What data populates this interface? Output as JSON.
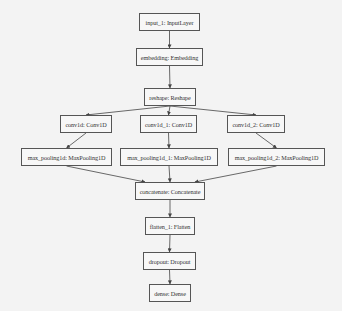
{
  "diagram": {
    "type": "keras-model-plot",
    "colors": {
      "background": "#f3f3f3",
      "node_border": "#555555",
      "edge": "#444444",
      "text": "#333333"
    },
    "nodes": [
      {
        "id": "input_1",
        "label": "input_1: InputLayer",
        "x": 139,
        "y": 13,
        "w": 61,
        "h": 18
      },
      {
        "id": "embedding",
        "label": "embedding: Embedding",
        "x": 136,
        "y": 48,
        "w": 67,
        "h": 18
      },
      {
        "id": "reshape",
        "label": "reshape: Reshape",
        "x": 144,
        "y": 88,
        "w": 52,
        "h": 18
      },
      {
        "id": "conv1d",
        "label": "conv1d: Conv1D",
        "x": 60,
        "y": 115,
        "w": 52,
        "h": 18
      },
      {
        "id": "conv1d_1",
        "label": "conv1d_1: Conv1D",
        "x": 140,
        "y": 115,
        "w": 57,
        "h": 18
      },
      {
        "id": "conv1d_2",
        "label": "conv1d_2: Conv1D",
        "x": 227,
        "y": 115,
        "w": 58,
        "h": 18
      },
      {
        "id": "max_pooling1d",
        "label": "max_pooling1d: MaxPooling1D",
        "x": 21,
        "y": 148,
        "w": 91,
        "h": 18
      },
      {
        "id": "max_pooling1d_1",
        "label": "max_pooling1d_1: MaxPooling1D",
        "x": 120,
        "y": 148,
        "w": 98,
        "h": 18
      },
      {
        "id": "max_pooling1d_2",
        "label": "max_pooling1d_2: MaxPooling1D",
        "x": 228,
        "y": 148,
        "w": 97,
        "h": 18
      },
      {
        "id": "concatenate",
        "label": "concatenate: Concatenate",
        "x": 135,
        "y": 182,
        "w": 70,
        "h": 18
      },
      {
        "id": "flatten_1",
        "label": "flatten_1: Flatten",
        "x": 145,
        "y": 217,
        "w": 50,
        "h": 18
      },
      {
        "id": "dropout",
        "label": "dropout: Dropout",
        "x": 143,
        "y": 252,
        "w": 53,
        "h": 18
      },
      {
        "id": "dense",
        "label": "dense: Dense",
        "x": 149,
        "y": 284,
        "w": 42,
        "h": 18
      }
    ],
    "edges": [
      {
        "from": "input_1",
        "to": "embedding"
      },
      {
        "from": "embedding",
        "to": "reshape"
      },
      {
        "from": "reshape",
        "to": "conv1d"
      },
      {
        "from": "reshape",
        "to": "conv1d_1"
      },
      {
        "from": "reshape",
        "to": "conv1d_2"
      },
      {
        "from": "conv1d",
        "to": "max_pooling1d"
      },
      {
        "from": "conv1d_1",
        "to": "max_pooling1d_1"
      },
      {
        "from": "conv1d_2",
        "to": "max_pooling1d_2"
      },
      {
        "from": "max_pooling1d",
        "to": "concatenate"
      },
      {
        "from": "max_pooling1d_1",
        "to": "concatenate"
      },
      {
        "from": "max_pooling1d_2",
        "to": "concatenate"
      },
      {
        "from": "concatenate",
        "to": "flatten_1"
      },
      {
        "from": "flatten_1",
        "to": "dropout"
      },
      {
        "from": "dropout",
        "to": "dense"
      }
    ]
  }
}
